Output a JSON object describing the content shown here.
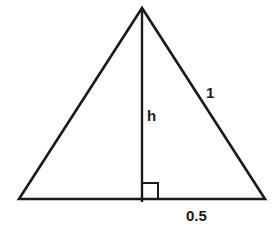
{
  "diagram": {
    "type": "geometry",
    "title": "",
    "shape": "isosceles triangle with altitude",
    "stroke_color": "#1a1a1a",
    "background_color": "#ffffff",
    "vertices": {
      "apex": [
        142,
        8
      ],
      "base_left": [
        19,
        199
      ],
      "base_right": [
        265,
        199
      ],
      "altitude_foot": [
        142,
        199
      ]
    },
    "right_angle_marker": {
      "x": 142,
      "y": 183,
      "size": 16
    },
    "labels": {
      "height": "h",
      "side": "1",
      "half_base": "0.5"
    }
  }
}
